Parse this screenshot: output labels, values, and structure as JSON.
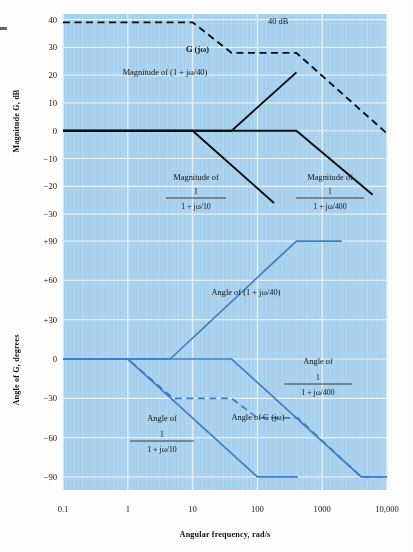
{
  "figure": {
    "background_color": "#a9d2ef",
    "page_color": "#ffffff",
    "curve_black": "#0d0d0d",
    "curve_blue": "#3b7fc6",
    "grid_color": "#cfe6f7"
  },
  "axes": {
    "x": {
      "label": "Angular frequency, rad/s",
      "ticks": [
        "0.1",
        "1",
        "10",
        "100",
        "1000",
        "10,000"
      ],
      "tick_values": [
        0.1,
        1,
        10,
        100,
        1000,
        10000
      ],
      "scale": "log",
      "range": [
        0.1,
        10000
      ]
    },
    "magnitude": {
      "label": "Magnitude G, dB",
      "ticks": [
        "40",
        "30",
        "20",
        "10",
        "0",
        "−10",
        "−20",
        "−30"
      ],
      "tick_values": [
        40,
        30,
        20,
        10,
        0,
        -10,
        -20,
        -30
      ],
      "range": [
        -35,
        42
      ]
    },
    "angle": {
      "label": "Angle of G, degrees",
      "ticks": [
        "+90",
        "+60",
        "+30",
        "0",
        "−30",
        "−60",
        "−90"
      ],
      "tick_values": [
        90,
        60,
        30,
        0,
        -30,
        -60,
        -90
      ],
      "range": [
        -100,
        100
      ]
    }
  },
  "annotations": {
    "forty_db": "40 dB",
    "g_jw": "G (jω)",
    "mag_numerator": "1",
    "mag_lead": "Magnitude of (1 + jω/40)",
    "mag_lag10_head": "Magnitude of",
    "mag_lag10_den": "1 + jω/10",
    "mag_lag400_head": "Magnitude of",
    "mag_lag400_den": "1 + jω/400",
    "ang_lead": "Angle of (1 + jω/40)",
    "ang_lag400_head": "Angle of",
    "ang_lag400_den": "1 + jω/400",
    "ang_lag10_head": "Angle of",
    "ang_lag10_den": "1 + jω/10",
    "ang_g": "Angle of G (jω)"
  },
  "chart_data": {
    "type": "line",
    "xlabel": "Angular frequency, rad/s",
    "xscale": "log",
    "xlim": [
      0.1,
      10000
    ],
    "grid": true,
    "legend": "inline annotations",
    "panels": [
      {
        "name": "magnitude",
        "ylabel": "Magnitude G, dB",
        "ylim": [
          -35,
          42
        ],
        "yticks": [
          40,
          30,
          20,
          10,
          0,
          -10,
          -20,
          -30
        ],
        "series": [
          {
            "name": "G (jω)",
            "style": "dashed",
            "color": "#0d0d0d",
            "points": [
              [
                0.1,
                39
              ],
              [
                10,
                39
              ],
              [
                40,
                28
              ],
              [
                400,
                28
              ],
              [
                10000,
                -1
              ]
            ]
          },
          {
            "name": "Magnitude of (1 + jω/40)",
            "style": "solid",
            "color": "#0d0d0d",
            "points": [
              [
                0.1,
                0
              ],
              [
                40,
                0
              ],
              [
                400,
                21
              ]
            ]
          },
          {
            "name": "Magnitude of 1/(1 + jω/10)",
            "style": "solid",
            "color": "#0d0d0d",
            "points": [
              [
                0.1,
                0
              ],
              [
                10,
                0
              ],
              [
                180,
                -26
              ]
            ]
          },
          {
            "name": "Magnitude of 1/(1 + jω/400)",
            "style": "solid",
            "color": "#0d0d0d",
            "points": [
              [
                0.1,
                0
              ],
              [
                400,
                0
              ],
              [
                6000,
                -23
              ]
            ]
          }
        ],
        "annotations": [
          {
            "text": "40 dB",
            "x": 700,
            "y": 38
          },
          {
            "text": "G (jω)",
            "x": 26,
            "y": 29
          },
          {
            "text": "Magnitude of (1 + jω/40)",
            "x": 12,
            "y": 15
          },
          {
            "text": "Magnitude of 1/(1 + jω/10)",
            "x": 6,
            "y": -22
          },
          {
            "text": "Magnitude of 1/(1 + jω/400)",
            "x": 500,
            "y": -22
          }
        ]
      },
      {
        "name": "angle",
        "ylabel": "Angle of G, degrees",
        "ylim": [
          -100,
          100
        ],
        "yticks": [
          90,
          60,
          30,
          0,
          -30,
          -60,
          -90
        ],
        "series": [
          {
            "name": "Angle of (1 + jω/40)",
            "style": "solid",
            "color": "#3b7fc6",
            "points": [
              [
                0.1,
                0
              ],
              [
                4.5,
                0
              ],
              [
                400,
                90
              ],
              [
                2000,
                90
              ]
            ]
          },
          {
            "name": "Angle of 1/(1 + jω/10)",
            "style": "solid",
            "color": "#3b7fc6",
            "points": [
              [
                0.1,
                0
              ],
              [
                1,
                0
              ],
              [
                100,
                -90
              ],
              [
                420,
                -90
              ]
            ]
          },
          {
            "name": "Angle of 1/(1 + jω/400)",
            "style": "solid",
            "color": "#3b7fc6",
            "points": [
              [
                0.1,
                0
              ],
              [
                40,
                0
              ],
              [
                4000,
                -90
              ],
              [
                10000,
                -90
              ]
            ]
          },
          {
            "name": "Angle of G (jω)",
            "style": "dashed",
            "color": "#3b7fc6",
            "points": [
              [
                0.1,
                0
              ],
              [
                1,
                0
              ],
              [
                5,
                -30
              ],
              [
                40,
                -30
              ],
              [
                100,
                -45
              ],
              [
                420,
                -45
              ],
              [
                4000,
                -90
              ],
              [
                10000,
                -90
              ]
            ]
          }
        ],
        "annotations": [
          {
            "text": "Angle of (1 + jω/40)",
            "x": 60,
            "y": 52
          },
          {
            "text": "Angle of 1/(1 + jω/400)",
            "x": 300,
            "y": -20
          },
          {
            "text": "Angle of 1/(1 + jω/10)",
            "x": 4,
            "y": -52
          },
          {
            "text": "Angle of G (jω)",
            "x": 30,
            "y": -48
          }
        ]
      }
    ]
  }
}
